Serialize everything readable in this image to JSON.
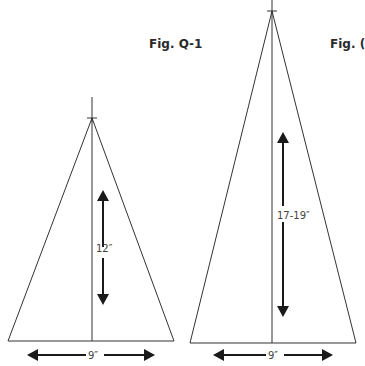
{
  "figures": [
    {
      "label": "Fig. Q-1",
      "height_dimension": "12″",
      "base_dimension": "9″"
    },
    {
      "label": "Fig. (",
      "height_dimension": "17-19″",
      "base_dimension": "9″"
    }
  ],
  "colors": {
    "line": "#333333",
    "arrow": "#1a1a1a",
    "text": "#444444"
  }
}
